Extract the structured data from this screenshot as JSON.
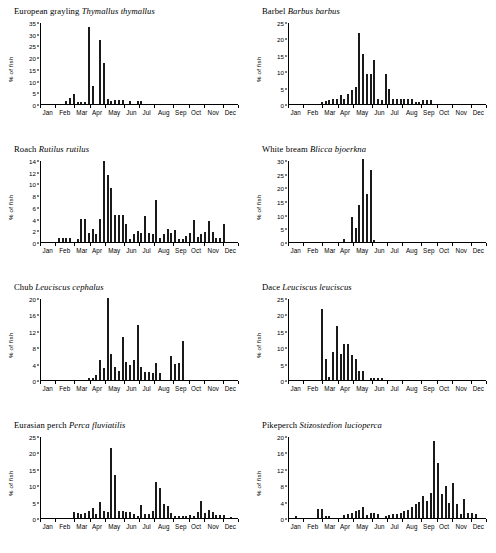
{
  "figure": {
    "ylabel": "% of fish",
    "months": [
      "Jan",
      "Feb",
      "Mar",
      "Apr",
      "May",
      "Jun",
      "Jul",
      "Aug",
      "Sep",
      "Oct",
      "Nov",
      "Dec"
    ]
  },
  "chart_data": [
    {
      "type": "bar",
      "title": "European grayling Thymallus thymallus",
      "common_name": "European grayling",
      "scientific_name": "Thymallus thymallus",
      "xlabel": "",
      "ylabel": "% of fish",
      "ylim": [
        0,
        35
      ],
      "yticks": [
        0,
        5,
        10,
        15,
        20,
        25,
        30,
        35
      ],
      "categories": [
        "Jan",
        "Feb",
        "Mar",
        "Apr",
        "May",
        "Jun",
        "Jul",
        "Aug",
        "Sep",
        "Oct",
        "Nov",
        "Dec"
      ],
      "x": "weekly bins across the year (52 bins)",
      "grid": false,
      "legend": "none",
      "values": [
        0,
        0,
        0,
        0,
        0,
        0,
        1.2,
        2.6,
        4.2,
        1.0,
        0.9,
        0.7,
        33.0,
        7.6,
        0,
        27.3,
        17.7,
        2.0,
        1.2,
        1.8,
        1.8,
        1.9,
        0,
        1.3,
        0,
        1.1,
        1.2,
        0,
        0,
        0,
        0,
        0,
        0,
        0,
        0,
        0,
        0,
        0,
        0,
        0,
        0,
        0,
        0,
        0,
        0,
        0,
        0,
        0,
        0,
        0,
        0,
        0
      ]
    },
    {
      "type": "bar",
      "title": "Barbel Barbus barbus",
      "common_name": "Barbel",
      "scientific_name": "Barbus barbus",
      "xlabel": "",
      "ylabel": "% of fish",
      "ylim": [
        0,
        25
      ],
      "yticks": [
        0,
        5,
        10,
        15,
        20,
        25
      ],
      "categories": [
        "Jan",
        "Feb",
        "Mar",
        "Apr",
        "May",
        "Jun",
        "Jul",
        "Aug",
        "Sep",
        "Oct",
        "Nov",
        "Dec"
      ],
      "x": "weekly bins across the year (52 bins)",
      "grid": false,
      "legend": "none",
      "values": [
        0,
        0,
        0,
        0,
        0,
        0,
        0,
        0,
        0.7,
        1.0,
        1.2,
        1.4,
        1.6,
        2.6,
        1.6,
        3.0,
        4.2,
        5.2,
        21.8,
        15.1,
        9.0,
        9.0,
        13.4,
        1.4,
        1.2,
        9.0,
        4.6,
        1.6,
        1.4,
        1.6,
        1.4,
        1.6,
        1.4,
        0.5,
        0.5,
        1.2,
        1.2,
        1.1,
        0,
        0,
        0,
        0,
        0,
        0,
        0,
        0,
        0,
        0,
        0,
        0,
        0,
        0
      ]
    },
    {
      "type": "bar",
      "title": "Roach Rutilus rutilus",
      "common_name": "Roach",
      "scientific_name": "Rutilus rutilus",
      "xlabel": "",
      "ylabel": "% of fish",
      "ylim": [
        0,
        14
      ],
      "yticks": [
        0,
        2,
        4,
        6,
        8,
        10,
        12,
        14
      ],
      "categories": [
        "Jan",
        "Feb",
        "Mar",
        "Apr",
        "May",
        "Jun",
        "Jul",
        "Aug",
        "Sep",
        "Oct",
        "Nov",
        "Dec"
      ],
      "x": "weekly bins across the year (52 bins)",
      "grid": false,
      "legend": "none",
      "values": [
        0,
        0,
        0,
        0,
        0.7,
        0.7,
        0.7,
        0.7,
        0,
        0.6,
        4.0,
        4.0,
        1.5,
        2.2,
        1.4,
        4.0,
        13.9,
        11.5,
        9.2,
        4.6,
        4.6,
        4.6,
        3.0,
        0.6,
        1.4,
        1.9,
        1.5,
        4.5,
        1.6,
        1.4,
        7.1,
        0.7,
        1.3,
        2.2,
        1.5,
        2.1,
        0.6,
        0.6,
        1.0,
        1.6,
        3.8,
        0.8,
        1.4,
        1.7,
        3.6,
        1.7,
        0.7,
        0.7,
        3.0,
        0,
        0,
        0
      ]
    },
    {
      "type": "bar",
      "title": "White bream Blicca bjoerkna",
      "common_name": "White bream",
      "scientific_name": "Blicca bjoerkna",
      "xlabel": "",
      "ylabel": "% of fish",
      "ylim": [
        0,
        30
      ],
      "yticks": [
        0,
        5,
        10,
        15,
        20,
        25,
        30
      ],
      "categories": [
        "Jan",
        "Feb",
        "Mar",
        "Apr",
        "May",
        "Jun",
        "Jul",
        "Aug",
        "Sep",
        "Oct",
        "Nov",
        "Dec"
      ],
      "x": "weekly bins across the year (52 bins)",
      "grid": false,
      "legend": "none",
      "values": [
        0,
        0,
        0,
        0,
        0,
        0,
        0,
        0,
        0,
        0,
        0,
        0,
        0,
        0,
        1.0,
        0,
        9.2,
        5.1,
        13.4,
        30.4,
        17.6,
        26.3,
        0.8,
        0,
        0,
        0,
        0,
        0,
        0,
        0,
        0,
        0,
        0,
        0,
        0,
        0,
        0,
        0,
        0,
        0,
        0,
        0,
        0,
        0,
        0,
        0,
        0,
        0,
        0,
        0,
        0,
        0
      ]
    },
    {
      "type": "bar",
      "title": "Chub Leuciscus cephalus",
      "common_name": "Chub",
      "scientific_name": "Leuciscus cephalus",
      "xlabel": "",
      "ylabel": "% of fish",
      "ylim": [
        0,
        20
      ],
      "yticks": [
        0,
        4,
        8,
        12,
        16,
        20
      ],
      "categories": [
        "Jan",
        "Feb",
        "Mar",
        "Apr",
        "May",
        "Jun",
        "Jul",
        "Aug",
        "Sep",
        "Oct",
        "Nov",
        "Dec"
      ],
      "x": "weekly bins across the year (52 bins)",
      "grid": false,
      "legend": "none",
      "values": [
        0,
        0,
        0,
        0,
        0,
        0,
        0,
        0,
        0,
        0,
        0,
        0,
        0.6,
        0.5,
        1.3,
        5.0,
        3.0,
        19.9,
        6.4,
        3.1,
        2.2,
        10.4,
        4.4,
        3.6,
        5.0,
        13.5,
        3.2,
        2.0,
        2.0,
        1.6,
        4.2,
        1.7,
        0,
        0,
        5.8,
        3.9,
        4.1,
        9.6,
        0,
        0,
        0,
        0,
        0,
        0,
        0,
        0,
        0,
        0,
        0,
        0,
        0,
        0
      ]
    },
    {
      "type": "bar",
      "title": "Dace Leuciscus leuciscus",
      "common_name": "Dace",
      "scientific_name": "Leuciscus leuciscus",
      "xlabel": "",
      "ylabel": "% of fish",
      "ylim": [
        0,
        25
      ],
      "yticks": [
        0,
        5,
        10,
        15,
        20,
        25
      ],
      "categories": [
        "Jan",
        "Feb",
        "Mar",
        "Apr",
        "May",
        "Jun",
        "Jul",
        "Aug",
        "Sep",
        "Oct",
        "Nov",
        "Dec"
      ],
      "x": "weekly bins across the year (52 bins)",
      "grid": false,
      "legend": "none",
      "values": [
        0,
        0,
        0,
        0,
        0,
        0,
        0,
        0,
        21.5,
        6.3,
        1.0,
        8.5,
        16.5,
        8.0,
        11.1,
        11.1,
        7.6,
        6.5,
        2.7,
        2.6,
        0,
        0.7,
        0.7,
        0.7,
        0.7,
        0,
        0,
        0,
        0,
        0,
        0,
        0,
        0,
        0,
        0,
        0,
        0,
        0,
        0,
        0,
        0,
        0,
        0,
        0,
        0,
        0,
        0,
        0,
        0,
        0,
        0,
        0
      ]
    },
    {
      "type": "bar",
      "title": "Eurasian perch Perca fluviatilis",
      "common_name": "Eurasian perch",
      "scientific_name": "Perca fluviatilis",
      "xlabel": "",
      "ylabel": "% of fish",
      "ylim": [
        0,
        25
      ],
      "yticks": [
        0,
        5,
        10,
        15,
        20,
        25
      ],
      "categories": [
        "Jan",
        "Feb",
        "Mar",
        "Apr",
        "May",
        "Jun",
        "Jul",
        "Aug",
        "Sep",
        "Oct",
        "Nov",
        "Dec"
      ],
      "x": "weekly bins across the year (52 bins)",
      "grid": false,
      "legend": "none",
      "values": [
        0,
        0,
        0,
        0,
        0,
        0,
        0,
        0,
        1.9,
        1.4,
        1.3,
        1.4,
        2.1,
        3.2,
        1.2,
        4.9,
        2.0,
        1.8,
        21.4,
        13.1,
        2.1,
        2.0,
        1.9,
        1.7,
        1.1,
        0.7,
        4.0,
        1.3,
        1.2,
        2.0,
        11.1,
        9.1,
        4.2,
        3.6,
        1.6,
        0.6,
        0.7,
        0.7,
        0.7,
        0.8,
        0.6,
        1.9,
        5.1,
        1.4,
        2.5,
        1.9,
        0.9,
        0.8,
        0.8,
        0,
        0.4,
        0
      ]
    },
    {
      "type": "bar",
      "title": "Pikeperch Stizostedion lucioperca",
      "common_name": "Pikeperch",
      "scientific_name": "Stizostedion lucioperca",
      "xlabel": "",
      "ylabel": "% of fish",
      "ylim": [
        0,
        20
      ],
      "yticks": [
        0,
        4,
        8,
        12,
        16,
        20
      ],
      "categories": [
        "Jan",
        "Feb",
        "Mar",
        "Apr",
        "May",
        "Jun",
        "Jul",
        "Aug",
        "Sep",
        "Oct",
        "Nov",
        "Dec"
      ],
      "x": "weekly bins across the year (52 bins)",
      "grid": false,
      "legend": "none",
      "values": [
        0,
        0.5,
        0,
        0,
        0,
        0,
        0,
        2.2,
        2.3,
        0.6,
        0.6,
        0,
        0,
        0,
        0.7,
        1.0,
        1.3,
        1.6,
        2.0,
        2.6,
        0.7,
        1.2,
        1.3,
        1.0,
        0,
        0.5,
        0.8,
        1.0,
        1.0,
        1.3,
        1.6,
        2.0,
        2.6,
        3.3,
        4.0,
        5.3,
        4.1,
        6.0,
        18.8,
        13.5,
        5.8,
        7.7,
        3.6,
        8.6,
        3.5,
        1.0,
        4.7,
        1.2,
        1.3,
        1.0,
        0,
        0
      ]
    }
  ]
}
